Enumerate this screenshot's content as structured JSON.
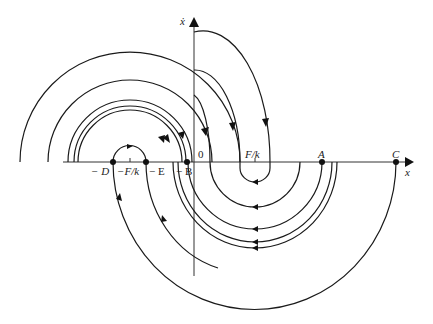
{
  "figure": {
    "type": "phase-plane diagram",
    "axes": {
      "x_label": "x",
      "y_label": "ẋ",
      "origin_label": "0"
    },
    "points": {
      "A": "A",
      "C": "C",
      "neg_D": "− D",
      "neg_E": "− E",
      "neg_B": "− B"
    },
    "ticks": {
      "neg_F_over_k": "−F/k",
      "F_over_k": "F/k"
    },
    "colors": {
      "curve": "#1a1a1a",
      "axis": "#333333",
      "background": "#ffffff"
    }
  }
}
